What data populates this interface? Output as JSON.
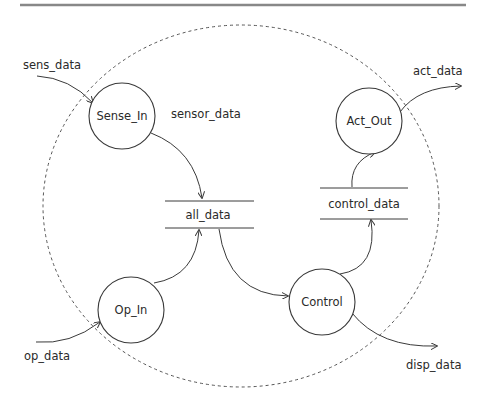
{
  "diagram": {
    "type": "data-flow-diagram",
    "boundary": {
      "style": "dashed-ellipse"
    },
    "processes": [
      {
        "id": "sense_in",
        "label": "Sense_In"
      },
      {
        "id": "act_out",
        "label": "Act_Out"
      },
      {
        "id": "op_in",
        "label": "Op_In"
      },
      {
        "id": "control",
        "label": "Control"
      }
    ],
    "stores": [
      {
        "id": "all_data",
        "label": "all_data"
      },
      {
        "id": "control_data",
        "label": "control_data"
      }
    ],
    "flows": [
      {
        "from": "external",
        "to": "sense_in",
        "label": "sens_data"
      },
      {
        "from": "sense_in",
        "to": "all_data",
        "label": "sensor_data"
      },
      {
        "from": "external",
        "to": "op_in",
        "label": "op_data"
      },
      {
        "from": "op_in",
        "to": "all_data",
        "label": ""
      },
      {
        "from": "all_data",
        "to": "control",
        "label": ""
      },
      {
        "from": "control",
        "to": "control_data",
        "label": ""
      },
      {
        "from": "control_data",
        "to": "act_out",
        "label": ""
      },
      {
        "from": "act_out",
        "to": "external",
        "label": "act_data"
      },
      {
        "from": "control",
        "to": "external",
        "label": "disp_data"
      }
    ]
  },
  "labels": {
    "sens_data": "sens_data",
    "sensor_data": "sensor_data",
    "op_data": "op_data",
    "act_data": "act_data",
    "disp_data": "disp_data",
    "sense_in": "Sense_In",
    "act_out": "Act_Out",
    "op_in": "Op_In",
    "control": "Control",
    "all_data": "all_data",
    "control_data": "control_data"
  }
}
